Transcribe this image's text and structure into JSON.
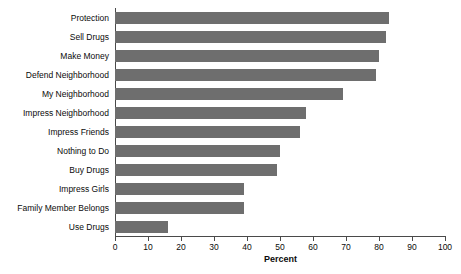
{
  "chart_data": {
    "type": "bar",
    "orientation": "horizontal",
    "title": "",
    "xlabel": "Percent",
    "ylabel": "",
    "xlim": [
      0,
      100
    ],
    "xticks": [
      0,
      10,
      20,
      30,
      40,
      50,
      60,
      70,
      80,
      90,
      100
    ],
    "grid": false,
    "legend": null,
    "bar_color": "#6e6e6e",
    "axis_color": "#4a4a4a",
    "text_color": "#0b0b0b",
    "categories": [
      "Protection",
      "Sell Drugs",
      "Make Money",
      "Defend Neighborhood",
      "My Neighborhood",
      "Impress Neighborhood",
      "Impress Friends",
      "Nothing to Do",
      "Buy Drugs",
      "Impress Girls",
      "Family Member Belongs",
      "Use Drugs"
    ],
    "values": [
      83,
      82,
      80,
      79,
      69,
      58,
      56,
      50,
      49,
      39,
      39,
      16
    ]
  }
}
